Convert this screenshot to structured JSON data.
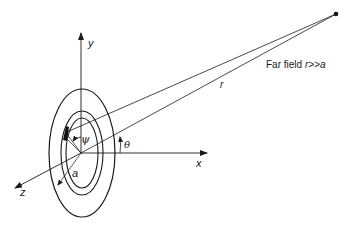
{
  "diagram": {
    "axes": {
      "x": "x",
      "y": "y",
      "z": "z"
    },
    "labels": {
      "angle_theta": "θ",
      "angle_psi": "ψ",
      "radius_a": "a",
      "distance_r": "r",
      "far_field_prefix": "Far field ",
      "far_field_condition": "r>>a"
    },
    "elements": {
      "center": [
        81,
        153
      ],
      "far_point": [
        336,
        14
      ],
      "outer_ellipse": {
        "rx": 33,
        "ry": 64
      },
      "inner_ring_outer": {
        "rx": 22,
        "ry": 42
      },
      "inner_ring_inner": {
        "rx": 17,
        "ry": 35
      }
    },
    "colors": {
      "stroke": "#1a1a1a",
      "background": "#ffffff"
    }
  }
}
